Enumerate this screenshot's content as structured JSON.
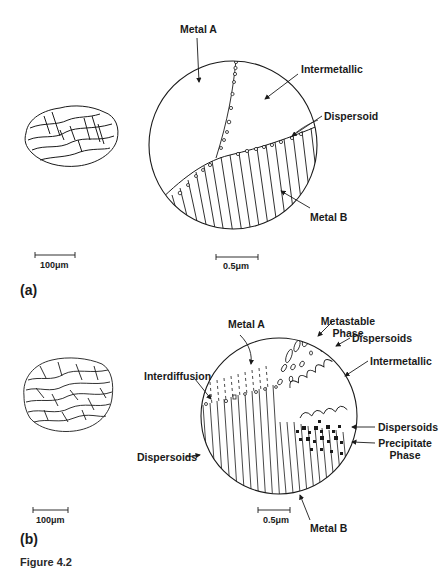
{
  "figure": {
    "panels": [
      {
        "tag": "(a)",
        "labels": {
          "metal_a": "Metal A",
          "intermetallic": "Intermetallic",
          "dispersoid": "Dispersoid",
          "metal_b": "Metal B"
        },
        "scale_bars": {
          "particle": "100μm",
          "detail": "0.5μm"
        }
      },
      {
        "tag": "(b)",
        "labels": {
          "metal_a": "Metal A",
          "metastable_phase_line1": "Metastable",
          "metastable_phase_line2": "Phase",
          "dispersoids_top": "Dispersoids",
          "intermetallic": "Intermetallic",
          "interdiffusion": "Interdiffusion",
          "dispersoids_right": "Dispersoids",
          "precipitate_phase_line1": "Precipitate",
          "precipitate_phase_line2": "Phase",
          "dispersoids_left": "Dispersoids",
          "metal_b": "Metal B"
        },
        "scale_bars": {
          "particle": "100μm",
          "detail": "0.5μm"
        }
      }
    ],
    "caption_stub": "Figure 4.2"
  },
  "colors": {
    "ink": "#1a1a1a",
    "paper": "#ffffff"
  }
}
